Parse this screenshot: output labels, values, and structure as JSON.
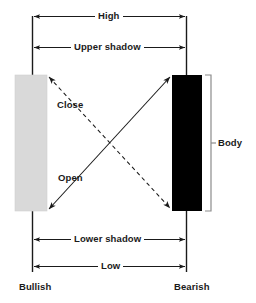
{
  "diagram": {
    "colors": {
      "bullish_body": "#d9d9d9",
      "bearish_body": "#000000",
      "line": "#1a1a1a",
      "bracket": "#8c8c8c",
      "background": "#ffffff",
      "text": "#1a1a1a"
    },
    "measure_labels": {
      "high": "High",
      "upper_shadow": "Upper shadow",
      "lower_shadow": "Lower shadow",
      "low": "Low",
      "body": "Body"
    },
    "price_labels": {
      "close": "Close",
      "open": "Open"
    },
    "candle_labels": {
      "bullish": "Bullish",
      "bearish": "Bearish"
    }
  }
}
